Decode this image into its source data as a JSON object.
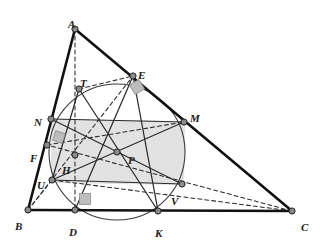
{
  "figure": {
    "kind": "euclidean-geometry-diagram",
    "width": 322,
    "height": 243,
    "background": "#ffffff"
  },
  "style": {
    "triangle_stroke": "#111111",
    "triangle_width": 2.6,
    "chord_stroke": "#2b2b2b",
    "chord_width": 1.25,
    "dashed_stroke": "#2b2b2b",
    "dashed_width": 1.05,
    "dash_pattern": "4,3",
    "circle_stroke": "#3a3a3a",
    "circle_width": 1.1,
    "vertex_fill": "#8a8a8a",
    "vertex_stroke": "#222222",
    "vertex_radius": 3.1,
    "rect_fill": "#d7d7d7",
    "rect_opacity": 0.72,
    "rightangle_fill": "#bdbdbd",
    "rightangle_stroke": "#8d8d8d",
    "label_color": "#1a1a1a"
  },
  "points": [
    {
      "id": "A",
      "label": "A",
      "x": 75,
      "y": 29,
      "lx": 68,
      "ly": 19,
      "role": "vertex"
    },
    {
      "id": "B",
      "label": "B",
      "x": 28,
      "y": 210,
      "lx": 15,
      "ly": 221,
      "role": "vertex"
    },
    {
      "id": "C",
      "label": "C",
      "x": 292,
      "y": 211,
      "lx": 301,
      "ly": 222,
      "role": "vertex"
    },
    {
      "id": "D",
      "label": "D",
      "x": 75,
      "y": 210,
      "lx": 69,
      "ly": 227,
      "role": "foot-of-altitude-from-A"
    },
    {
      "id": "E",
      "label": "E",
      "x": 133,
      "y": 76,
      "lx": 138,
      "ly": 70,
      "role": "foot-of-altitude-from-B"
    },
    {
      "id": "F",
      "label": "F",
      "x": 47,
      "y": 145,
      "lx": 30,
      "ly": 153,
      "role": "foot-of-altitude-from-C"
    },
    {
      "id": "H",
      "label": "H",
      "x": 75,
      "y": 155,
      "lx": 62,
      "ly": 165,
      "role": "orthocenter"
    },
    {
      "id": "P",
      "label": "P",
      "x": 117,
      "y": 152,
      "lx": 128,
      "ly": 155,
      "role": "nine-point-center"
    },
    {
      "id": "N",
      "label": "N",
      "x": 51,
      "y": 119,
      "lx": 34,
      "ly": 117,
      "role": "midpoint-AB"
    },
    {
      "id": "M",
      "label": "M",
      "x": 184,
      "y": 122,
      "lx": 190,
      "ly": 113,
      "role": "midpoint-AC"
    },
    {
      "id": "K",
      "label": "K",
      "x": 158,
      "y": 211,
      "lx": 155,
      "ly": 228,
      "role": "midpoint-BC"
    },
    {
      "id": "T",
      "label": "T",
      "x": 79,
      "y": 89,
      "lx": 80,
      "ly": 78,
      "role": "euler-point-AH"
    },
    {
      "id": "U",
      "label": "U",
      "x": 52,
      "y": 180,
      "lx": 37,
      "ly": 180,
      "role": "euler-point-BH"
    },
    {
      "id": "V",
      "label": "V",
      "x": 182,
      "y": 184,
      "lx": 171,
      "ly": 196,
      "role": "euler-point-CH"
    }
  ],
  "circle": {
    "name": "nine-point-circle",
    "cx": 117,
    "cy": 152,
    "r": 68
  },
  "shaded_rectangle": {
    "name": "rectangle-NMVU",
    "vertices": [
      "N",
      "M",
      "V",
      "U"
    ],
    "path": "51,119 185,121 184,185 51,183"
  },
  "solid_segments": [
    {
      "name": "side-AB",
      "from": "A",
      "to": "B",
      "kind": "triangle"
    },
    {
      "name": "side-AC",
      "from": "A",
      "to": "C",
      "kind": "triangle"
    },
    {
      "name": "side-BC",
      "from": "B",
      "to": "C",
      "kind": "triangle"
    },
    {
      "name": "chord-NM",
      "from": "N",
      "to": "M",
      "kind": "chord"
    },
    {
      "name": "chord-UV",
      "from": "U",
      "to": "V",
      "kind": "chord"
    },
    {
      "name": "diameter-NV",
      "from": "N",
      "to": "V",
      "kind": "diameter"
    },
    {
      "name": "diameter-UM",
      "from": "U",
      "to": "M",
      "kind": "diameter"
    },
    {
      "name": "diameter-TK",
      "from": "T",
      "to": "K",
      "kind": "diameter"
    },
    {
      "name": "segment-TU",
      "from": "T",
      "to": "U",
      "kind": "chord"
    },
    {
      "name": "segment-DE",
      "from": "D",
      "to": "E",
      "kind": "chord"
    },
    {
      "name": "segment-EK",
      "from": "E",
      "to": "K",
      "kind": "chord"
    }
  ],
  "dashed_segments": [
    {
      "name": "altitude-AD",
      "from": "A",
      "to": "D"
    },
    {
      "name": "altitude-BE",
      "from": "B",
      "to": "E"
    },
    {
      "name": "altitude-CF",
      "from": "C",
      "to": "F"
    },
    {
      "name": "segment-HV-C",
      "from": "U",
      "to": "C"
    },
    {
      "name": "segment-UB",
      "from": "U",
      "to": "B"
    },
    {
      "name": "segment-FH-M",
      "from": "F",
      "to": "M"
    },
    {
      "name": "segment-TE",
      "from": "T",
      "to": "E"
    }
  ],
  "right_angle_marks": [
    {
      "name": "right-angle-at-E",
      "at": "E",
      "cx": 137,
      "cy": 87,
      "size": 11,
      "rotate": -32
    },
    {
      "name": "right-angle-at-F",
      "at": "F",
      "cx": 59,
      "cy": 137,
      "size": 10,
      "rotate": 18
    },
    {
      "name": "right-angle-at-D",
      "at": "D",
      "cx": 85,
      "cy": 199,
      "size": 11,
      "rotate": 0
    }
  ]
}
